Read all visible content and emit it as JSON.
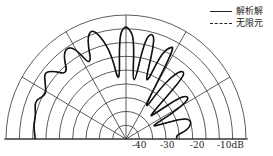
{
  "chart_data": {
    "type": "polar",
    "title": "",
    "radial_unit": "dB",
    "radial_range": [
      -45,
      0
    ],
    "radial_tick_labels": [
      "-40",
      "-30",
      "-20",
      "-10dB"
    ],
    "angular_range_deg": [
      0,
      180
    ],
    "angular_gridlines_deg": [
      0,
      30,
      60,
      90,
      120,
      150,
      180
    ],
    "ring_count": 9,
    "legend": [
      {
        "label": "解析解",
        "style": "solid"
      },
      {
        "label": "无限元",
        "style": "dashed"
      }
    ],
    "series": [
      {
        "name": "解析解",
        "style": "solid",
        "theta_deg": [
          180,
          172,
          165,
          158,
          152,
          147,
          142,
          138,
          133,
          128,
          124,
          120,
          116,
          112,
          108,
          104,
          100,
          97,
          94,
          91,
          88,
          85,
          82,
          79,
          76,
          73,
          70,
          67,
          64,
          61,
          58,
          55,
          52,
          49,
          46,
          43,
          40,
          37,
          34,
          31,
          28,
          25,
          22,
          19,
          16,
          13,
          10,
          7,
          4,
          0
        ],
        "r_db": [
          -11,
          -10,
          -10,
          -8,
          -11,
          -9,
          -6,
          -8,
          -13,
          -7,
          -5,
          -7,
          -16,
          -6,
          -3,
          -7,
          -14,
          -26,
          -8,
          -4,
          -5,
          -9,
          -28,
          -9,
          -5,
          -8,
          -26,
          -12,
          -8,
          -7,
          -35,
          -22,
          -15,
          -12,
          -14,
          -34,
          -30,
          -20,
          -17,
          -18,
          -26,
          -35,
          -30,
          -22,
          -20,
          -20,
          -21,
          -23,
          -26,
          -26
        ]
      },
      {
        "name": "无限元",
        "style": "dashed",
        "theta_deg": [
          180,
          172,
          165,
          158,
          152,
          147,
          142,
          138,
          133,
          128,
          124,
          120,
          116,
          112,
          108,
          104,
          100,
          97,
          94,
          91,
          88,
          85,
          82,
          79,
          76,
          73,
          70,
          67,
          64,
          61,
          58,
          55,
          52,
          49,
          46,
          43,
          40,
          37,
          34,
          31,
          28,
          25,
          22,
          19,
          16,
          13,
          10,
          7,
          4,
          0
        ],
        "r_db": [
          -11,
          -10,
          -10,
          -8,
          -11,
          -9,
          -6,
          -8,
          -13,
          -7,
          -5,
          -7,
          -16,
          -6,
          -3,
          -7,
          -14,
          -26,
          -8,
          -4,
          -5,
          -9,
          -28,
          -9,
          -5,
          -8,
          -26,
          -12,
          -8,
          -7,
          -35,
          -22,
          -15,
          -12,
          -14,
          -34,
          -30,
          -20,
          -17,
          -18,
          -26,
          -35,
          -30,
          -22,
          -20,
          -20,
          -21,
          -23,
          -26,
          -26
        ]
      }
    ],
    "grid": true,
    "legend_position": "top-right"
  }
}
